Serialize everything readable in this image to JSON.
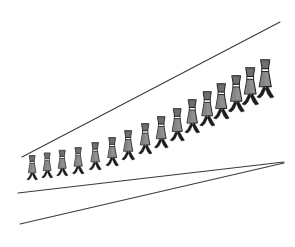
{
  "image": {
    "title": "Ponzo corridor illusion with walking figures",
    "width": 295,
    "height": 247,
    "background_color": "#ffffff"
  },
  "chart_data": {
    "type": "scatter",
    "xlabel": "",
    "ylabel": "",
    "xlim": [
      0,
      295
    ],
    "ylim": [
      0,
      247
    ],
    "grid": false,
    "legend": null,
    "annotations": [
      "Identical walking figures placed along a receding corridor",
      "Figures appear to grow larger toward the right vanishing region"
    ],
    "series": [
      {
        "name": "walking-figures",
        "description": "Row of identical silhouetted walkers, each slightly scaled, marching left to right",
        "count": 16,
        "x": [
          32,
          47,
          62,
          78,
          95,
          112,
          128,
          145,
          161,
          177,
          192,
          207,
          221,
          236,
          250,
          265
        ],
        "y": [
          180,
          178,
          176,
          174,
          170,
          166,
          160,
          154,
          148,
          141,
          133,
          126,
          119,
          112,
          105,
          98
        ],
        "scale": [
          0.74,
          0.76,
          0.78,
          0.8,
          0.83,
          0.86,
          0.89,
          0.92,
          0.95,
          0.98,
          1.01,
          1.04,
          1.07,
          1.1,
          1.13,
          1.16
        ]
      }
    ],
    "lines": [
      {
        "name": "upper-corridor-line",
        "x": [
          22,
          280
        ],
        "y": [
          157,
          22
        ],
        "stroke": "#3a3a3a",
        "width": 1
      },
      {
        "name": "middle-corridor-line",
        "x": [
          18,
          284
        ],
        "y": [
          193,
          162
        ],
        "stroke": "#3a3a3a",
        "width": 1
      },
      {
        "name": "lower-corridor-line",
        "x": [
          20,
          284
        ],
        "y": [
          224,
          163
        ],
        "stroke": "#3a3a3a",
        "width": 1
      }
    ]
  },
  "figure_style": {
    "hat_color": "#6e6e6e",
    "collar_color": "#ffffff",
    "body_color": "#8f8f8f",
    "leg_color": "#1c1c1c",
    "outline_color": "#1c1c1c"
  },
  "caption": ""
}
